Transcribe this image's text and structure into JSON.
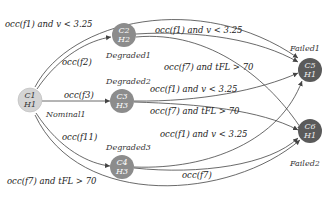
{
  "diagram": {
    "type": "state-transition",
    "colors": {
      "initial": "#d4d4d4",
      "degraded": "#8c8c8c",
      "failed": "#5a5a5a",
      "edge": "#444444"
    },
    "nodes": [
      {
        "id": "n1",
        "top": "C1",
        "bottom": "H1",
        "state": "Nominal1"
      },
      {
        "id": "n2",
        "top": "C2",
        "bottom": "H2",
        "state": "Degraded1"
      },
      {
        "id": "n3",
        "top": "C3",
        "bottom": "H3",
        "state": "Degraded2"
      },
      {
        "id": "n4",
        "top": "C4",
        "bottom": "H3",
        "state": "Degraded3"
      },
      {
        "id": "n5",
        "top": "C5",
        "bottom": "H1",
        "state": "Failed1"
      },
      {
        "id": "n6",
        "top": "C6",
        "bottom": "H1",
        "state": "Failed2"
      }
    ],
    "edges": [
      {
        "from": "n1",
        "to": "n2",
        "label": "occ(f2)"
      },
      {
        "from": "n1",
        "to": "n3",
        "label": "occ(f3)"
      },
      {
        "from": "n1",
        "to": "n4",
        "label": "occ(f11)"
      },
      {
        "from": "n1",
        "to": "n5",
        "label": "occ(f1) and v < 3.25"
      },
      {
        "from": "n1",
        "to": "n6",
        "label": "occ(f7) and tFL > 70"
      },
      {
        "from": "n2",
        "to": "n5",
        "label": "occ(f1) and v < 3.25"
      },
      {
        "from": "n2",
        "to": "n6",
        "label": "occ(f7) and tFL > 70"
      },
      {
        "from": "n3",
        "to": "n5",
        "label": "occ(f1) and v < 3.25"
      },
      {
        "from": "n3",
        "to": "n6",
        "label": "occ(f7) and tFL > 70"
      },
      {
        "from": "n4",
        "to": "n5",
        "label": "occ(f1) and v < 3.25"
      },
      {
        "from": "n4",
        "to": "n6",
        "label": "occ(f7)"
      }
    ]
  }
}
